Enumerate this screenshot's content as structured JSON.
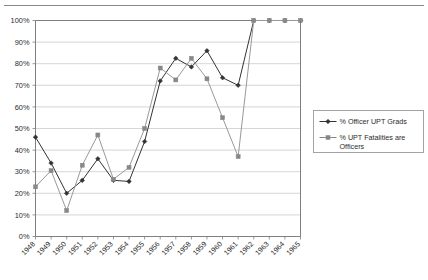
{
  "figure": {
    "name": "officer-upt-line-chart",
    "width": 428,
    "height": 280,
    "background": "#ffffff",
    "top_rule_color": "#888888"
  },
  "chart_data": {
    "type": "line",
    "title": "",
    "subtitle": "",
    "xlabel": "",
    "ylabel": "",
    "categories": [
      "1948",
      "1949",
      "1950",
      "1951",
      "1952",
      "1953",
      "1954",
      "1955",
      "1956",
      "1957",
      "1958",
      "1959",
      "1960",
      "1961",
      "1962",
      "1963",
      "1964",
      "1965"
    ],
    "ylim": [
      0,
      100
    ],
    "ytick_labels": [
      "0%",
      "10%",
      "20%",
      "30%",
      "40%",
      "50%",
      "60%",
      "70%",
      "80%",
      "90%",
      "100%"
    ],
    "ytick_values": [
      0,
      10,
      20,
      30,
      40,
      50,
      60,
      70,
      80,
      90,
      100
    ],
    "grid": "horizontal",
    "grid_color": "#cccccc",
    "axis_color": "#808080",
    "legend_position": "right",
    "series": [
      {
        "name": "% Officer UPT Grads",
        "marker": "diamond",
        "color": "#333333",
        "line_color": "#333333",
        "values": [
          46,
          34,
          20,
          26,
          36,
          26,
          25.5,
          44,
          72,
          82.5,
          78.5,
          86,
          73.5,
          70,
          100,
          100,
          100,
          100
        ]
      },
      {
        "name": "% UPT Fatalities are Officers",
        "marker": "square",
        "color": "#888888",
        "line_color": "#999999",
        "values": [
          23,
          30.5,
          12,
          33,
          47,
          26.5,
          32,
          50,
          78,
          72.5,
          82.5,
          73,
          55,
          37,
          100,
          100,
          100,
          100
        ]
      }
    ]
  },
  "legend": {
    "entries": [
      {
        "label": "% Officer UPT Grads",
        "marker": "diamond",
        "color": "#333333"
      },
      {
        "label": "% UPT Fatalities are Officers",
        "marker": "square",
        "color": "#888888"
      }
    ],
    "border_color": "#9a9a9a"
  }
}
